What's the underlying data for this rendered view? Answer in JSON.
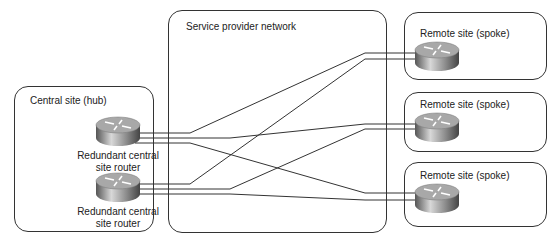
{
  "diagram": {
    "central_site": {
      "label": "Central site (hub)",
      "routers": [
        {
          "label_line1": "Redundant central",
          "label_line2": "site router"
        },
        {
          "label_line1": "Redundant central",
          "label_line2": "site router"
        }
      ]
    },
    "provider": {
      "label": "Service provider network"
    },
    "remote_sites": [
      {
        "label": "Remote site (spoke)"
      },
      {
        "label": "Remote site (spoke)"
      },
      {
        "label": "Remote site (spoke)"
      }
    ],
    "colors": {
      "line": "#333333",
      "box_border": "#333333",
      "router_body": "#9a9a9a"
    }
  }
}
